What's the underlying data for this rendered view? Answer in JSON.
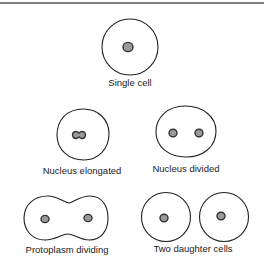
{
  "diagram": {
    "stages": [
      {
        "id": "single-cell",
        "label": "Single cell"
      },
      {
        "id": "nucleus-elongated",
        "label": "Nucleus elongated"
      },
      {
        "id": "nucleus-divided",
        "label": "Nucleus divided"
      },
      {
        "id": "protoplasm-dividing",
        "label": "Protoplasm dividing"
      },
      {
        "id": "two-daughter-cells",
        "label": "Two daughter cells"
      }
    ],
    "colors": {
      "outline": "#222222",
      "nucleus_fill": "#9a9a9a",
      "rule": "#555555"
    }
  }
}
